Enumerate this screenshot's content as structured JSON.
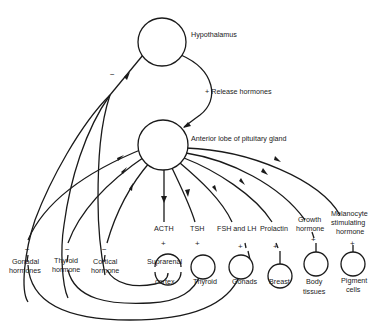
{
  "diagram": {
    "nodes": {
      "hypothalamus": "Hypothalamus",
      "anterior_pituitary": "Anterior lobe of pituitary gland",
      "suprarenal_top": "Suprarenal",
      "suprarenal_bottom": "cortex",
      "thyroid": "Thyroid",
      "gonads": "Gonads",
      "breast": "Breast",
      "body_tissues_1": "Body",
      "body_tissues_2": "tissues",
      "pigment_cells_1": "Pigment",
      "pigment_cells_2": "cells"
    },
    "edges": {
      "release_hormones": "+ Release hormones",
      "negative_feedback": "−"
    },
    "pituitary_hormones": {
      "acth": "ACTH",
      "tsh": "TSH",
      "fsh_lh": "FSH and LH",
      "prolactin": "Prolactin",
      "growth_1": "Growth",
      "growth_2": "hormone",
      "msh_1": "Melanocyte",
      "msh_2": "stimulating",
      "msh_3": "hormone"
    },
    "feedback_hormones": {
      "gonadal_1": "Gonadal",
      "gonadal_2": "hormones",
      "thyroid_1": "Thyroid",
      "thyroid_2": "hormone",
      "cortical_1": "Cortical",
      "cortical_2": "hormone"
    },
    "signs": {
      "plus": "+",
      "minus": "−"
    }
  }
}
